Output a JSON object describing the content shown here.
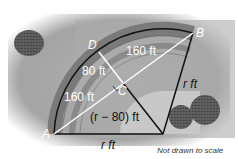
{
  "diagram": {
    "type": "geometry",
    "points": {
      "A": "A",
      "B": "B",
      "C": "C",
      "D": "D"
    },
    "labels": {
      "db_segment": "160 ft",
      "dc_segment": "80 ft",
      "ad_segment": "160 ft",
      "center_c": "(r − 80) ft",
      "radius_right": "r ft",
      "radius_bottom": "r ft"
    },
    "note": "Not drawn to scale",
    "colors": {
      "background": "#a9a9a9",
      "track": "#6f6f6f",
      "inner_field": "#c4c4c4",
      "line_dark": "#111111",
      "line_light": "#ffffff",
      "bush": "#5a5a5a"
    }
  }
}
